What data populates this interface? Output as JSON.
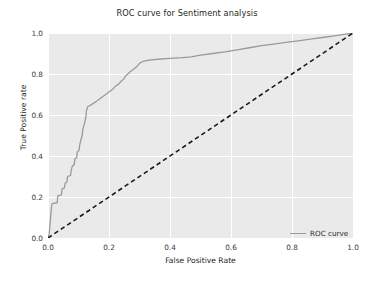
{
  "chart_data": {
    "type": "line",
    "title": "ROC curve for Sentiment analysis",
    "xlabel": "False Positive Rate",
    "ylabel": "True Positive rate",
    "xlim": [
      0.0,
      1.0
    ],
    "ylim": [
      0.0,
      1.0
    ],
    "xticks": [
      "0.0",
      "0.2",
      "0.4",
      "0.6",
      "0.8",
      "1.0"
    ],
    "xtick_values": [
      0.0,
      0.2,
      0.4,
      0.6,
      0.8,
      1.0
    ],
    "yticks": [
      "0.0",
      "0.2",
      "0.4",
      "0.6",
      "0.8",
      "1.0"
    ],
    "ytick_values": [
      0.0,
      0.2,
      0.4,
      0.6,
      0.8,
      1.0
    ],
    "grid": true,
    "grid_color": "#ffffff",
    "plot_background": "#eaeaea",
    "legend_position": "lower right",
    "series": [
      {
        "name": "ROC curve",
        "color": "#9a9a9a",
        "linestyle": "solid",
        "linewidth": 1.3,
        "points": [
          [
            0.0,
            0.0
          ],
          [
            0.004,
            0.02
          ],
          [
            0.006,
            0.055
          ],
          [
            0.008,
            0.09
          ],
          [
            0.01,
            0.125
          ],
          [
            0.012,
            0.16
          ],
          [
            0.014,
            0.168
          ],
          [
            0.03,
            0.172
          ],
          [
            0.032,
            0.205
          ],
          [
            0.044,
            0.21
          ],
          [
            0.046,
            0.24
          ],
          [
            0.054,
            0.245
          ],
          [
            0.056,
            0.268
          ],
          [
            0.062,
            0.272
          ],
          [
            0.064,
            0.3
          ],
          [
            0.074,
            0.305
          ],
          [
            0.076,
            0.33
          ],
          [
            0.08,
            0.352
          ],
          [
            0.086,
            0.358
          ],
          [
            0.088,
            0.385
          ],
          [
            0.094,
            0.392
          ],
          [
            0.096,
            0.42
          ],
          [
            0.102,
            0.428
          ],
          [
            0.104,
            0.455
          ],
          [
            0.108,
            0.478
          ],
          [
            0.112,
            0.5
          ],
          [
            0.114,
            0.53
          ],
          [
            0.12,
            0.56
          ],
          [
            0.124,
            0.588
          ],
          [
            0.126,
            0.62
          ],
          [
            0.13,
            0.64
          ],
          [
            0.14,
            0.648
          ],
          [
            0.16,
            0.668
          ],
          [
            0.18,
            0.69
          ],
          [
            0.2,
            0.712
          ],
          [
            0.214,
            0.728
          ],
          [
            0.222,
            0.742
          ],
          [
            0.23,
            0.748
          ],
          [
            0.238,
            0.762
          ],
          [
            0.248,
            0.775
          ],
          [
            0.254,
            0.79
          ],
          [
            0.262,
            0.8
          ],
          [
            0.27,
            0.812
          ],
          [
            0.28,
            0.822
          ],
          [
            0.292,
            0.838
          ],
          [
            0.3,
            0.852
          ],
          [
            0.312,
            0.862
          ],
          [
            0.33,
            0.868
          ],
          [
            0.36,
            0.872
          ],
          [
            0.4,
            0.876
          ],
          [
            0.44,
            0.88
          ],
          [
            0.47,
            0.884
          ],
          [
            0.5,
            0.892
          ],
          [
            0.54,
            0.9
          ],
          [
            0.58,
            0.908
          ],
          [
            0.62,
            0.918
          ],
          [
            0.66,
            0.928
          ],
          [
            0.7,
            0.938
          ],
          [
            0.74,
            0.946
          ],
          [
            0.78,
            0.954
          ],
          [
            0.82,
            0.962
          ],
          [
            0.86,
            0.97
          ],
          [
            0.9,
            0.978
          ],
          [
            0.94,
            0.986
          ],
          [
            0.97,
            0.993
          ],
          [
            1.0,
            1.0
          ]
        ]
      },
      {
        "name": "chance-diagonal",
        "color": "#1a1a1a",
        "linestyle": "dashed",
        "linewidth": 1.6,
        "points": [
          [
            0.0,
            0.0
          ],
          [
            1.0,
            1.0
          ]
        ]
      }
    ],
    "legend": [
      {
        "label": "ROC curve",
        "color": "#9a9a9a",
        "linestyle": "solid"
      }
    ]
  }
}
